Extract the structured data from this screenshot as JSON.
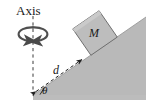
{
  "figure": {
    "background_color": "#ffffff",
    "width": 155,
    "height": 108
  },
  "labels": {
    "axis": "Axis",
    "mass": "M",
    "distance": "d",
    "angle": "θ"
  },
  "colors": {
    "incline_fill": "#b9b9b9",
    "incline_edge": "#8f8f8f",
    "block_fill": "#bdbdbd",
    "block_edge": "#6e6e6e",
    "line": "#2b2b2b",
    "text": "#1a1a1a"
  },
  "elements": {
    "incline": {
      "name": "inclined-plane",
      "apex_x": 146,
      "apex_y": 17,
      "base_x": 33,
      "base_y": 95,
      "angle_deg": 35
    },
    "block": {
      "name": "block-mass-M",
      "center_x": 95,
      "center_y": 33,
      "size": 32,
      "rotation_deg": -35
    },
    "rotation_axis": {
      "name": "rotation-axis-dashed-line",
      "x": 33,
      "top_y": 16,
      "bottom_y": 92,
      "style": "dashed"
    },
    "spin_arrows": {
      "name": "rotation-direction-arrows",
      "center_x": 33,
      "center_y": 34,
      "rx": 15,
      "ry": 7
    },
    "distance_arrow": {
      "name": "distance-measure-arrow",
      "from_x": 34,
      "from_y": 93,
      "to_x": 84,
      "to_y": 58,
      "style": "dashed double-headed"
    }
  }
}
